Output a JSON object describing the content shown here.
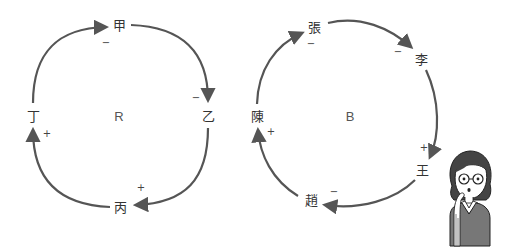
{
  "colors": {
    "arrow": "#555555",
    "text": "#333333",
    "background": "#ffffff"
  },
  "loop_r": {
    "label": "R",
    "nodes": [
      {
        "id": "jia",
        "label": "甲",
        "x": 119,
        "y": 25
      },
      {
        "id": "yi",
        "label": "乙",
        "x": 208,
        "y": 116
      },
      {
        "id": "bing",
        "label": "丙",
        "x": 120,
        "y": 207
      },
      {
        "id": "ding",
        "label": "丁",
        "x": 33,
        "y": 116
      }
    ],
    "signs": [
      {
        "text": "−",
        "near": "甲",
        "x": 106,
        "y": 43
      },
      {
        "text": "−",
        "near": "乙",
        "x": 196,
        "y": 98
      },
      {
        "text": "+",
        "near": "丙",
        "x": 141,
        "y": 188
      },
      {
        "text": "+",
        "near": "丁",
        "x": 47,
        "y": 134
      }
    ]
  },
  "loop_b": {
    "label": "B",
    "nodes": [
      {
        "id": "zhang",
        "label": "張",
        "x": 314,
        "y": 27
      },
      {
        "id": "li",
        "label": "李",
        "x": 421,
        "y": 59
      },
      {
        "id": "wang",
        "label": "王",
        "x": 422,
        "y": 170
      },
      {
        "id": "zhao",
        "label": "趙",
        "x": 311,
        "y": 200
      },
      {
        "id": "chen",
        "label": "陳",
        "x": 257,
        "y": 116
      }
    ],
    "signs": [
      {
        "text": "−",
        "near": "張",
        "x": 311,
        "y": 44
      },
      {
        "text": "−",
        "near": "李",
        "x": 398,
        "y": 52
      },
      {
        "text": "+",
        "near": "王",
        "x": 424,
        "y": 148
      },
      {
        "text": "−",
        "near": "趙",
        "x": 334,
        "y": 192
      },
      {
        "text": "+",
        "near": "陳",
        "x": 271,
        "y": 132
      }
    ]
  },
  "illustration": {
    "subject": "woman with glasses, finger to chin, thinking"
  }
}
